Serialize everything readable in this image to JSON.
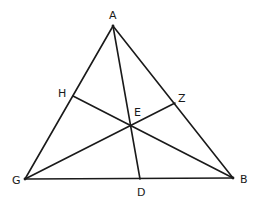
{
  "diagram": {
    "type": "geometry-triangle-cevians",
    "background": "#ffffff",
    "stroke_color": "#1a1a1a",
    "points": {
      "A": {
        "x": 113,
        "y": 26
      },
      "G": {
        "x": 25,
        "y": 179
      },
      "B": {
        "x": 233,
        "y": 178
      },
      "D": {
        "x": 140,
        "y": 179
      },
      "H": {
        "x": 73,
        "y": 96
      },
      "Z": {
        "x": 175,
        "y": 103
      },
      "E": {
        "x": 131,
        "y": 125
      }
    },
    "labels": [
      {
        "id": "A",
        "text": "A",
        "x": 109,
        "y": 19
      },
      {
        "id": "H",
        "text": "H",
        "x": 58,
        "y": 97
      },
      {
        "id": "Z",
        "text": "Z",
        "x": 178,
        "y": 102
      },
      {
        "id": "E",
        "text": "E",
        "x": 134,
        "y": 116
      },
      {
        "id": "G",
        "text": "G",
        "x": 12,
        "y": 184
      },
      {
        "id": "B",
        "text": "B",
        "x": 240,
        "y": 183
      },
      {
        "id": "D",
        "text": "D",
        "x": 137,
        "y": 196
      }
    ],
    "segments": [
      {
        "name": "side-AG",
        "from": "A",
        "to": "G"
      },
      {
        "name": "side-AB",
        "from": "A",
        "to": "B"
      },
      {
        "name": "side-GB",
        "from": "G",
        "to": "B"
      },
      {
        "name": "cevian-AD",
        "from": "A",
        "to": "D"
      },
      {
        "name": "cevian-HB",
        "from": "H",
        "to": "B"
      },
      {
        "name": "cevian-GZ",
        "from": "G",
        "to": "Z"
      }
    ]
  }
}
